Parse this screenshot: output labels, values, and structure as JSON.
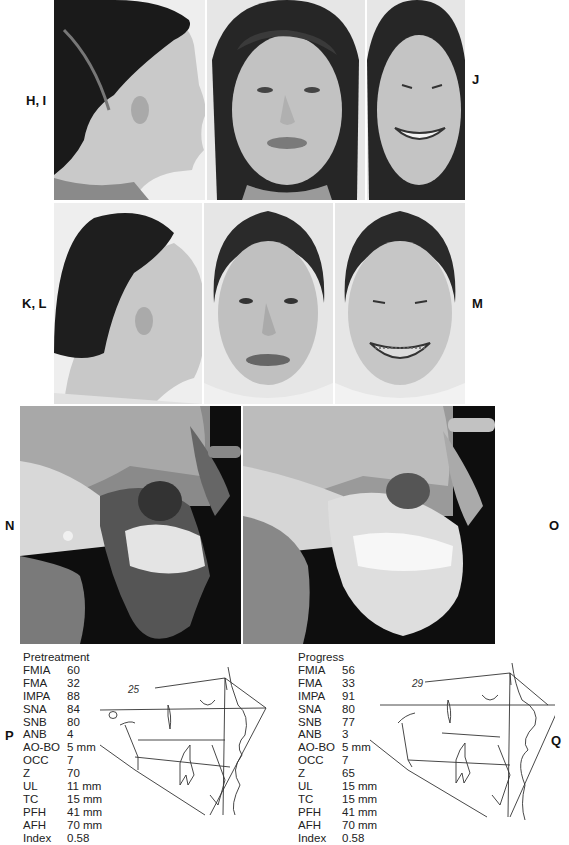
{
  "figure": {
    "row1": {
      "label_left": "H, I",
      "label_right": "J",
      "panels": [
        {
          "name": "profile",
          "description": "pretreatment facial profile photo"
        },
        {
          "name": "frontal-rest",
          "description": "pretreatment frontal photo at rest"
        },
        {
          "name": "frontal-smile",
          "description": "pretreatment frontal smile photo"
        }
      ]
    },
    "row2": {
      "label_left": "K, L",
      "label_right": "M",
      "panels": [
        {
          "name": "profile",
          "description": "progress facial profile photo"
        },
        {
          "name": "frontal-rest",
          "description": "progress frontal photo at rest"
        },
        {
          "name": "frontal-smile",
          "description": "progress frontal smile photo with braces"
        }
      ]
    },
    "row3": {
      "label_left": "N",
      "label_right": "O",
      "panels": [
        {
          "name": "ceph-pretreatment",
          "description": "pretreatment lateral cephalometric radiograph"
        },
        {
          "name": "ceph-progress",
          "description": "progress lateral cephalometric radiograph"
        }
      ]
    },
    "row4": {
      "label_left": "P",
      "label_right": "Q",
      "tables": [
        {
          "title": "Pretreatment",
          "rows": [
            {
              "k": "FMIA",
              "v": "60"
            },
            {
              "k": "FMA",
              "v": "32"
            },
            {
              "k": "IMPA",
              "v": "88"
            },
            {
              "k": "SNA",
              "v": "84"
            },
            {
              "k": "SNB",
              "v": "80"
            },
            {
              "k": "ANB",
              "v": "4"
            },
            {
              "k": "AO-BO",
              "v": "5 mm"
            },
            {
              "k": "OCC",
              "v": "7"
            },
            {
              "k": "Z",
              "v": "70"
            },
            {
              "k": "UL",
              "v": "11 mm"
            },
            {
              "k": "TC",
              "v": "15 mm"
            },
            {
              "k": "PFH",
              "v": "41 mm"
            },
            {
              "k": "AFH",
              "v": "70 mm"
            },
            {
              "k": "Index",
              "v": "0.58"
            }
          ],
          "tracing_annotation": "25"
        },
        {
          "title": "Progress",
          "rows": [
            {
              "k": "FMIA",
              "v": "56"
            },
            {
              "k": "FMA",
              "v": "33"
            },
            {
              "k": "IMPA",
              "v": "91"
            },
            {
              "k": "SNA",
              "v": "80"
            },
            {
              "k": "SNB",
              "v": "77"
            },
            {
              "k": "ANB",
              "v": "3"
            },
            {
              "k": "AO-BO",
              "v": "5 mm"
            },
            {
              "k": "OCC",
              "v": "7"
            },
            {
              "k": "Z",
              "v": "65"
            },
            {
              "k": "UL",
              "v": "15 mm"
            },
            {
              "k": "TC",
              "v": "15 mm"
            },
            {
              "k": "PFH",
              "v": "41 mm"
            },
            {
              "k": "AFH",
              "v": "70 mm"
            },
            {
              "k": "Index",
              "v": "0.58"
            }
          ],
          "tracing_annotation": "29"
        }
      ]
    }
  }
}
